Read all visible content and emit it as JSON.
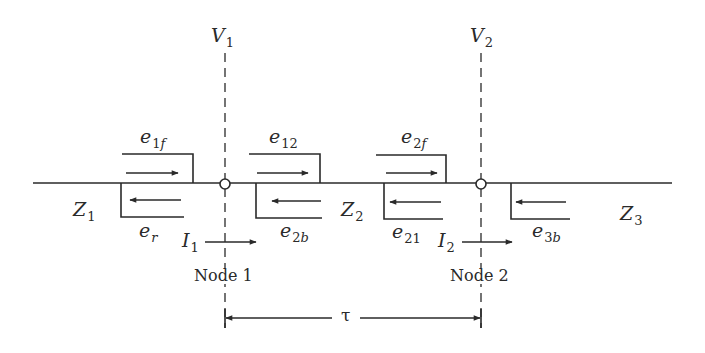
{
  "diagram": {
    "type": "transmission-line-junction",
    "colors": {
      "stroke": "#2a2a2a",
      "background": "#ffffff"
    },
    "voltages": [
      {
        "symbol": "V",
        "subscript": "1"
      },
      {
        "symbol": "V",
        "subscript": "2"
      }
    ],
    "impedances": [
      {
        "symbol": "Z",
        "subscript": "1"
      },
      {
        "symbol": "Z",
        "subscript": "2"
      },
      {
        "symbol": "Z",
        "subscript": "3"
      }
    ],
    "waves": {
      "e1f": {
        "symbol": "e",
        "sub_main": "1",
        "sub_italic": "f",
        "direction": "right"
      },
      "er": {
        "symbol": "e",
        "sub_main": "",
        "sub_italic": "r",
        "direction": "left"
      },
      "e12": {
        "symbol": "e",
        "sub_main": "12",
        "sub_italic": "",
        "direction": "right"
      },
      "e2b": {
        "symbol": "e",
        "sub_main": "2",
        "sub_italic": "b",
        "direction": "left"
      },
      "e2f": {
        "symbol": "e",
        "sub_main": "2",
        "sub_italic": "f",
        "direction": "right"
      },
      "e21": {
        "symbol": "e",
        "sub_main": "21",
        "sub_italic": "",
        "direction": "left"
      },
      "e3b": {
        "symbol": "e",
        "sub_main": "3",
        "sub_italic": "b",
        "direction": "left"
      }
    },
    "currents": [
      {
        "symbol": "I",
        "subscript": "1",
        "direction": "right"
      },
      {
        "symbol": "I",
        "subscript": "2",
        "direction": "right"
      }
    ],
    "nodes": [
      {
        "label": "Node 1"
      },
      {
        "label": "Node 2"
      }
    ],
    "travel_time": {
      "symbol": "τ"
    }
  }
}
